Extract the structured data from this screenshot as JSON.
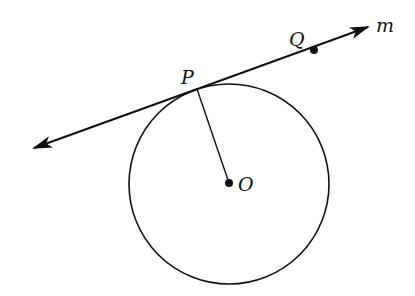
{
  "diagram": {
    "type": "geometry",
    "labels": {
      "P": "P",
      "Q": "Q",
      "O": "O",
      "m": "m"
    },
    "points": {
      "O": [
        229,
        183
      ],
      "P": [
        197,
        88
      ],
      "Q": [
        314,
        50
      ]
    },
    "circle": {
      "center": "O",
      "radius": 100
    },
    "line_m": {
      "from": [
        34,
        148
      ],
      "to": [
        368,
        27
      ],
      "arrows": "both"
    },
    "segments": [
      [
        "O",
        "P"
      ]
    ],
    "colors": {
      "stroke": "#111111",
      "background": "#ffffff"
    }
  }
}
